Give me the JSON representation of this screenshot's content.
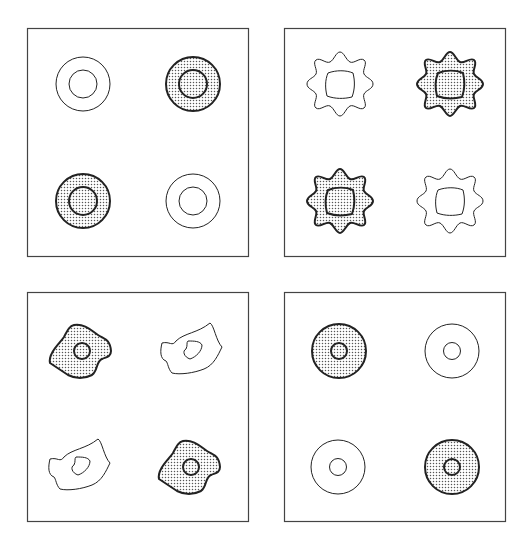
{
  "figure": {
    "colors": {
      "stroke": "#222222",
      "fill_dots": "#555555",
      "background": "#ffffff",
      "frame": "#444444"
    },
    "panels": [
      {
        "id": "top-left",
        "shape": "concentric-circles",
        "items": [
          "outline",
          "stippled",
          "stippled",
          "outline"
        ]
      },
      {
        "id": "top-right",
        "shape": "gear",
        "items": [
          "outline",
          "stippled",
          "stippled",
          "outline"
        ]
      },
      {
        "id": "bottom-left",
        "shape": "irregular-blob",
        "items": [
          "stippled",
          "outline",
          "outline",
          "stippled"
        ]
      },
      {
        "id": "bottom-right",
        "shape": "concentric-circles-small-hole",
        "items": [
          "stippled",
          "outline",
          "outline",
          "stippled"
        ]
      }
    ]
  }
}
